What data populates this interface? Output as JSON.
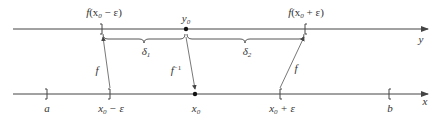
{
  "diagram": {
    "colors": {
      "line": "#444444",
      "text": "#333333",
      "background": "#ffffff"
    },
    "top_axis": {
      "name": "y",
      "label": "y",
      "marks": [
        {
          "id": "f_minus",
          "label_fn": "f",
          "label_arg": "(x",
          "label_sub": "0",
          "label_rest": " − ε)",
          "type": "bracket-right"
        },
        {
          "id": "y0",
          "label": "y",
          "label_sub": "0",
          "type": "dot"
        },
        {
          "id": "f_plus",
          "label_fn": "f",
          "label_arg": "(x",
          "label_sub": "0",
          "label_rest": " + ε)",
          "type": "bracket-left"
        }
      ],
      "braces": [
        {
          "id": "delta1",
          "label": "δ",
          "label_sub": "1"
        },
        {
          "id": "delta2",
          "label": "δ",
          "label_sub": "2"
        }
      ]
    },
    "bottom_axis": {
      "name": "x",
      "label": "x",
      "marks": [
        {
          "id": "a",
          "label": "a",
          "type": "bracket-right"
        },
        {
          "id": "x0_minus",
          "label": "x",
          "label_sub": "0",
          "label_rest": " − ε",
          "type": "bracket-right"
        },
        {
          "id": "x0",
          "label": "x",
          "label_sub": "0",
          "type": "dot"
        },
        {
          "id": "x0_plus",
          "label": "x",
          "label_sub": "0",
          "label_rest": " + ε",
          "type": "bracket-left"
        },
        {
          "id": "b",
          "label": "b",
          "type": "bracket-left"
        }
      ]
    },
    "arrows": [
      {
        "id": "f_left",
        "label": "f",
        "from": "x0_minus",
        "to": "f_minus"
      },
      {
        "id": "f_inverse",
        "label": "f",
        "label_sup": "−1",
        "from": "y0",
        "to": "x0"
      },
      {
        "id": "f_right",
        "label": "f",
        "from": "x0_plus",
        "to": "f_plus"
      }
    ]
  }
}
